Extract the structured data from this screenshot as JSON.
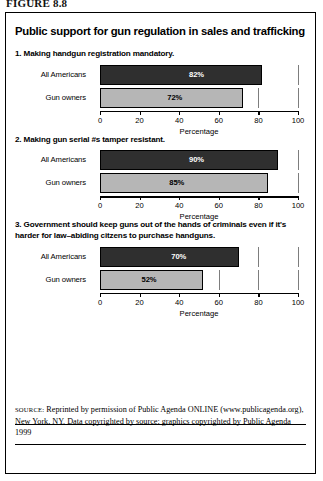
{
  "figure_label": "FIGURE 8.8",
  "title": "Public support for gun regulation in sales and trafficking",
  "source": {
    "prefix": "SOURCE:",
    "text": " Reprinted by permission of Public Agenda ONLINE (www.publicagenda.org), New York, NY. Data copyrighted by source; graphics copyrighted by Public Agenda 1999"
  },
  "colors": {
    "dark_bar": "#2f2f2f",
    "light_bar": "#b6b6b6",
    "axis": "#000000",
    "grid": "#7d7d7d",
    "border": "#000000"
  },
  "chart_data": [
    {
      "type": "bar",
      "orientation": "horizontal",
      "title": "1. Making handgun registration mandatory.",
      "categories": [
        "All Americans",
        "Gun owners"
      ],
      "values": [
        82,
        72
      ],
      "value_labels": [
        "82%",
        "72%"
      ],
      "xlabel": "Percentage",
      "ylabel": "",
      "xlim": [
        0,
        100
      ],
      "xticks": [
        0,
        20,
        40,
        60,
        80,
        100
      ],
      "xticklabels": [
        "0",
        "20",
        "40",
        "60",
        "80",
        "100"
      ],
      "grid": true,
      "legend": "none"
    },
    {
      "type": "bar",
      "orientation": "horizontal",
      "title": "2. Making gun serial #s tamper resistant.",
      "categories": [
        "All Americans",
        "Gun owners"
      ],
      "values": [
        90,
        85
      ],
      "value_labels": [
        "90%",
        "85%"
      ],
      "xlabel": "Percentage",
      "ylabel": "",
      "xlim": [
        0,
        100
      ],
      "xticks": [
        0,
        20,
        40,
        60,
        80,
        100
      ],
      "xticklabels": [
        "0",
        "20",
        "40",
        "60",
        "80",
        "100"
      ],
      "grid": true,
      "legend": "none"
    },
    {
      "type": "bar",
      "orientation": "horizontal",
      "title": "3. Government should keep guns out of the hands of criminals even if it's harder for law–abiding citzens to purchase handguns.",
      "categories": [
        "All Americans",
        "Gun owners"
      ],
      "values": [
        70,
        52
      ],
      "value_labels": [
        "70%",
        "52%"
      ],
      "xlabel": "Percentage",
      "ylabel": "",
      "xlim": [
        0,
        100
      ],
      "xticks": [
        0,
        20,
        40,
        60,
        80,
        100
      ],
      "xticklabels": [
        "0",
        "20",
        "40",
        "60",
        "80",
        "100"
      ],
      "grid": true,
      "legend": "none"
    }
  ]
}
